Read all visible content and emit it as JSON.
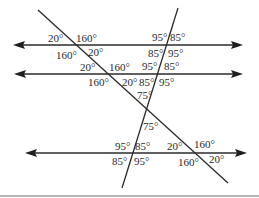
{
  "diagram": {
    "type": "parallel-lines-and-transversals",
    "horizontal_lines": [
      {
        "id": "line-1",
        "y": 45,
        "x1": 13,
        "x2": 243
      },
      {
        "id": "line-2",
        "y": 74,
        "x1": 14,
        "x2": 243
      },
      {
        "id": "line-3",
        "y": 153,
        "x1": 25,
        "x2": 247
      }
    ],
    "transversals": [
      {
        "id": "transversal-a",
        "x1": 38,
        "y1": 10,
        "x2": 228,
        "y2": 183
      },
      {
        "id": "transversal-b",
        "x1": 178,
        "y1": 8,
        "x2": 122,
        "y2": 188
      }
    ],
    "angle_labels": {
      "a_l1_tl": "20°",
      "a_l1_tr": "160°",
      "a_l1_bl": "160°",
      "a_l1_br": "20°",
      "b_l1_tl": "95°",
      "b_l1_tr": "85°",
      "b_l1_bl": "85°",
      "b_l1_br": "95°",
      "a_l2_tl": "20°",
      "a_l2_tr": "160°",
      "a_l2_bl": "160°",
      "a_l2_br": "20°",
      "b_l2_tl": "95°",
      "b_l2_tr": "85°",
      "b_l2_bl": "85°",
      "b_l2_br": "95°",
      "x_top": "75°",
      "x_bottom": "75°",
      "b_l3_tl": "95°",
      "b_l3_tr": "85°",
      "b_l3_bl": "85°",
      "b_l3_br": "95°",
      "a_l3_tl": "20°",
      "a_l3_tr": "160°",
      "a_l3_bl": "160°",
      "a_l3_br": "20°"
    },
    "colors": {
      "line": "#2b2b2b",
      "text": "#2a2a2a",
      "rule": "#9a9a9a"
    }
  }
}
